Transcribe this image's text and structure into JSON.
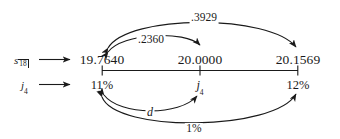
{
  "figure": {
    "type": "number-line-diagram",
    "background_color": "#ffffff",
    "ink_color": "#1a1a1a"
  },
  "row_labels": {
    "top": {
      "symbol": "s",
      "subscript": "18",
      "full": "s 18|"
    },
    "bottom": {
      "symbol": "j",
      "subscript": "4",
      "full": "j4"
    }
  },
  "scale": {
    "top_values": [
      "19.7640",
      "20.0000",
      "20.1569"
    ],
    "bottom_values": [
      "11%",
      "j",
      "12%"
    ],
    "bottom_middle_subscript": "4",
    "tick_count": 3
  },
  "arcs": {
    "upper_outer": {
      "label": ".3929",
      "from": "19.7640",
      "to": "20.1569",
      "arrowheads": "both"
    },
    "upper_inner": {
      "label": ".2360",
      "from": "19.7640",
      "to": "20.0000",
      "arrowheads": "both"
    },
    "lower_inner": {
      "label": "d",
      "from": "11%",
      "to": "j4",
      "arrowheads": "both"
    },
    "lower_outer": {
      "label": "1%",
      "from": "11%",
      "to": "12%",
      "arrowheads": "both"
    }
  }
}
